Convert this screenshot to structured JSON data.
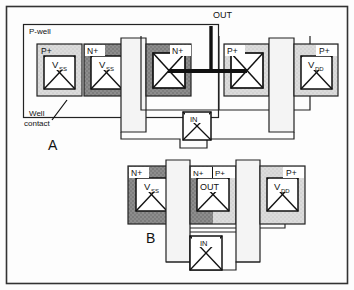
{
  "figure": {
    "outer_frame": true,
    "colors": {
      "ink": "#111111",
      "paper": "#fdfdfd",
      "nwell_light": "#d9d9d9",
      "pwell_hatch": "#c9c9c9",
      "diffusion_dark": "#6e6e6e",
      "diffusion_mid": "#9a9a9a",
      "poly_gate": "#f2f2f2",
      "metal_wire": "#111111"
    },
    "panels": [
      {
        "id": "A",
        "label": "A",
        "label_x": 48,
        "label_y": 146,
        "annotations": [
          {
            "name": "p-well-label",
            "text": "P-well",
            "x": 29,
            "y": 33
          },
          {
            "name": "well-contact-label",
            "text": "Well",
            "x": 30,
            "y": 113
          },
          {
            "name": "well-contact-label-2",
            "text": "contact",
            "x": 24,
            "y": 123
          },
          {
            "name": "out-label",
            "text": "OUT",
            "x": 213,
            "y": 18
          }
        ],
        "cells": [
          {
            "name": "cell-a-vss-pplus",
            "doping": "P+",
            "doping_side": "left",
            "contact_text": "V",
            "contact_sub": "SS",
            "shade": "light"
          },
          {
            "name": "cell-a-vss-nplus",
            "doping": "N+",
            "doping_side": "left",
            "contact_text": "V",
            "contact_sub": "SS",
            "shade": "dark"
          },
          {
            "name": "cell-a-nmos-drain",
            "doping": "N+",
            "doping_side": "right",
            "contact_text": "",
            "contact_sub": "",
            "shade": "dark"
          },
          {
            "name": "cell-a-pmos-drain",
            "doping": "P+",
            "doping_side": "left",
            "contact_text": "",
            "contact_sub": "",
            "shade": "light"
          },
          {
            "name": "cell-a-vdd-pplus",
            "doping": "P+",
            "doping_side": "right",
            "contact_text": "V",
            "contact_sub": "DD",
            "shade": "light"
          }
        ],
        "gate_contact": {
          "name": "gate-contact-in-a",
          "text": "IN"
        }
      },
      {
        "id": "B",
        "label": "B",
        "label_x": 146,
        "label_y": 238,
        "annotations": [],
        "cells": [
          {
            "name": "cell-b-vss-nplus",
            "doping": "N+",
            "doping_side": "left",
            "contact_text": "V",
            "contact_sub": "SS",
            "shade": "dark"
          },
          {
            "name": "cell-b-out-shared",
            "doping": "N+",
            "doping_side": "left",
            "doping2": "P+",
            "contact_text": "OUT",
            "contact_sub": "",
            "shade": "split"
          },
          {
            "name": "cell-b-vdd-pplus",
            "doping": "P+",
            "doping_side": "right",
            "contact_text": "V",
            "contact_sub": "DD",
            "shade": "light"
          }
        ],
        "gate_contact": {
          "name": "gate-contact-in-b",
          "text": "IN"
        }
      }
    ]
  }
}
